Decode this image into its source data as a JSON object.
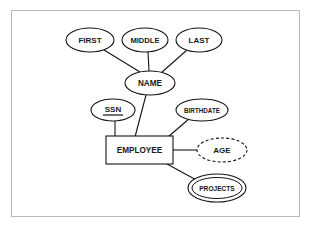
{
  "diagram": {
    "kind": "er-diagram",
    "frame": {
      "visible": true,
      "color": "#b9b9b9",
      "x": 11,
      "y": 10,
      "width": 289,
      "height": 207
    },
    "colors": {
      "background": "#ffffff",
      "stroke": "#141414",
      "text": "#1a1a1a",
      "frame": "#b9b9b9"
    },
    "entities": [
      {
        "id": "employee",
        "label": "EMPLOYEE",
        "shape": "rectangle",
        "role": "entity",
        "x": 106,
        "y": 136,
        "width": 67,
        "height": 28,
        "font_size": 8.2
      }
    ],
    "attributes": [
      {
        "id": "first",
        "label": "FIRST",
        "shape": "ellipse",
        "role": "simple-attribute",
        "cx": 90,
        "cy": 40,
        "rx": 24,
        "ry": 12,
        "font_size": 8
      },
      {
        "id": "middle",
        "label": "MIDDLE",
        "shape": "ellipse",
        "role": "simple-attribute",
        "cx": 145,
        "cy": 40,
        "rx": 23,
        "ry": 12,
        "font_size": 7.6
      },
      {
        "id": "last",
        "label": "LAST",
        "shape": "ellipse",
        "role": "simple-attribute",
        "cx": 199,
        "cy": 40,
        "rx": 23,
        "ry": 12,
        "font_size": 8
      },
      {
        "id": "name",
        "label": "NAME",
        "shape": "ellipse",
        "role": "composite-attribute",
        "cx": 150,
        "cy": 83,
        "rx": 25,
        "ry": 12,
        "font_size": 8.2
      },
      {
        "id": "ssn",
        "label": "SSN",
        "shape": "ellipse",
        "role": "key-attribute",
        "underlined": true,
        "cx": 113,
        "cy": 110,
        "rx": 22,
        "ry": 11,
        "font_size": 8
      },
      {
        "id": "birthdate",
        "label": "BIRTHDATE",
        "shape": "ellipse",
        "role": "simple-attribute",
        "cx": 202,
        "cy": 110,
        "rx": 26,
        "ry": 11,
        "font_size": 6.3
      },
      {
        "id": "age",
        "label": "AGE",
        "shape": "ellipse-dashed",
        "role": "derived-attribute",
        "cx": 222,
        "cy": 150,
        "rx": 25,
        "ry": 12,
        "font_size": 8
      },
      {
        "id": "projects",
        "label": "PROJECTS",
        "shape": "double-ellipse",
        "role": "multivalued-attribute",
        "cx": 217,
        "cy": 188,
        "rx": 29,
        "ry": 14,
        "inner_rx": 25,
        "inner_ry": 10.5,
        "font_size": 6.6
      }
    ],
    "edges": [
      {
        "id": "edge-first-name",
        "from": "first",
        "to": "name",
        "x1": 104,
        "y1": 50,
        "x2": 140,
        "y2": 72
      },
      {
        "id": "edge-middle-name",
        "from": "middle",
        "to": "name",
        "x1": 148,
        "y1": 52,
        "x2": 149,
        "y2": 71
      },
      {
        "id": "edge-last-name",
        "from": "last",
        "to": "name",
        "x1": 187,
        "y1": 50,
        "x2": 161,
        "y2": 73
      },
      {
        "id": "edge-name-employee",
        "from": "name",
        "to": "employee",
        "x1": 146,
        "y1": 95,
        "x2": 135,
        "y2": 136
      },
      {
        "id": "edge-ssn-employee",
        "from": "ssn",
        "to": "employee",
        "x1": 115,
        "y1": 121,
        "x2": 115,
        "y2": 136
      },
      {
        "id": "edge-birthdate-employee",
        "from": "birthdate",
        "to": "employee",
        "x1": 190,
        "y1": 118,
        "x2": 168,
        "y2": 136
      },
      {
        "id": "edge-employee-age",
        "from": "employee",
        "to": "age",
        "x1": 173,
        "y1": 150,
        "x2": 197,
        "y2": 150
      },
      {
        "id": "edge-employee-projects",
        "from": "employee",
        "to": "projects",
        "x1": 167,
        "y1": 164,
        "x2": 199,
        "y2": 182
      }
    ]
  }
}
